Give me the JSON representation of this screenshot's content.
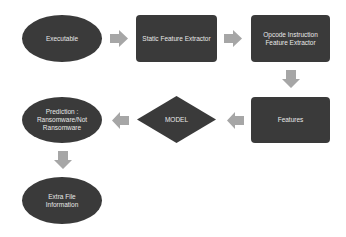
{
  "diagram": {
    "nodes": {
      "executable": "Executable",
      "static_extractor": "Static Feature Extractor",
      "opcode_extractor": "Opcode Instruction Feature Extractor",
      "features": "Features",
      "model": "MODEL",
      "prediction": "Prediction : Ransomware/Not Ransomware",
      "extra_info": "Extra File Information"
    },
    "colors": {
      "node_fill": "#3a3a3a",
      "node_text": "#e8e8e8",
      "arrow": "#a6a6a6"
    },
    "edges": [
      [
        "executable",
        "static_extractor"
      ],
      [
        "static_extractor",
        "opcode_extractor"
      ],
      [
        "opcode_extractor",
        "features"
      ],
      [
        "features",
        "model"
      ],
      [
        "model",
        "prediction"
      ],
      [
        "prediction",
        "extra_info"
      ]
    ]
  }
}
